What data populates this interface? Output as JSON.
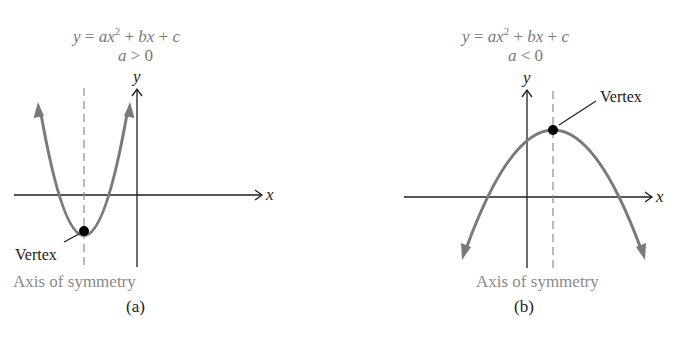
{
  "figure": {
    "panels": [
      {
        "id": "a",
        "equation": {
          "lhs": "y",
          "eq": "=",
          "a": "a",
          "x": "x",
          "exp": "2",
          "plus1": "+",
          "b": "b",
          "x2": "x",
          "plus2": "+",
          "c": "c"
        },
        "condition": {
          "var": "a",
          "op": ">",
          "val": "0"
        },
        "y_axis_label": "y",
        "x_axis_label": "x",
        "vertex_label": "Vertex",
        "axis_of_symmetry_label": "Axis of symmetry",
        "panel_label": "(a)",
        "opens": "up"
      },
      {
        "id": "b",
        "equation": {
          "lhs": "y",
          "eq": "=",
          "a": "a",
          "x": "x",
          "exp": "2",
          "plus1": "+",
          "b": "b",
          "x2": "x",
          "plus2": "+",
          "c": "c"
        },
        "condition": {
          "var": "a",
          "op": "<",
          "val": "0"
        },
        "y_axis_label": "y",
        "x_axis_label": "x",
        "vertex_label": "Vertex",
        "axis_of_symmetry_label": "Axis of symmetry",
        "panel_label": "(b)",
        "opens": "down"
      }
    ],
    "colors": {
      "curve": "#7a7a7a",
      "axes": "#1e1e1e",
      "dashed_axis": "#8c8c8c",
      "vertex_dot": "#000000",
      "equation_text": "#7a7a7a",
      "aos_text": "#8a8a8a"
    }
  }
}
